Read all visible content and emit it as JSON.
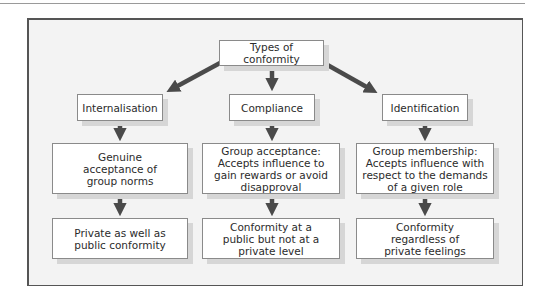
{
  "diagram": {
    "root": {
      "label": "Types of conformity"
    },
    "types": [
      {
        "label": "Internalisation",
        "description": "Genuine acceptance of group norms",
        "outcome": "Private as well as public conformity"
      },
      {
        "label": "Compliance",
        "description": "Group acceptance: Accepts influence to gain rewards or avoid disapproval",
        "outcome": "Conformity at a public but not at a private level"
      },
      {
        "label": "Identification",
        "description": "Group membership: Accepts influence with respect to the demands of a given role",
        "outcome": "Conformity regardless of private feelings"
      }
    ],
    "colors": {
      "arrow": "#4a4a4a",
      "frame_background": "#f3f3f3",
      "box_background": "#ffffff",
      "box_border": "#8a8a8a",
      "shadow": "#d6d6d6"
    }
  }
}
